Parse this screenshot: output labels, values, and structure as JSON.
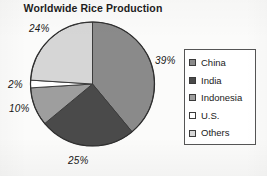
{
  "chart_data": {
    "type": "pie",
    "title": "Worldwide Rice Production",
    "xlabel": "",
    "ylabel": "",
    "legend_position": "right",
    "grid": false,
    "categories": [
      "China",
      "India",
      "Indonesia",
      "U.S.",
      "Others"
    ],
    "values": [
      39,
      25,
      10,
      2,
      24
    ],
    "value_labels": [
      "39%",
      "25%",
      "10%",
      "2%",
      "24%"
    ],
    "units": "percent",
    "start_angle_deg": 0,
    "direction": "clockwise",
    "slice_colors": [
      "#8a8a8a",
      "#4a4a4a",
      "#9e9e9e",
      "#ffffff",
      "#d6d6d6"
    ],
    "slices": [
      {
        "name": "China",
        "value": 39,
        "label": "39%",
        "color": "#8a8a8a"
      },
      {
        "name": "India",
        "value": 25,
        "label": "25%",
        "color": "#4a4a4a"
      },
      {
        "name": "Indonesia",
        "value": 10,
        "label": "10%",
        "color": "#9e9e9e"
      },
      {
        "name": "U.S.",
        "value": 2,
        "label": "2%",
        "color": "#ffffff"
      },
      {
        "name": "Others",
        "value": 24,
        "label": "24%",
        "color": "#d6d6d6"
      }
    ]
  },
  "title": "Worldwide Rice Production",
  "labels": {
    "china": "39%",
    "india": "25%",
    "indonesia": "10%",
    "us": "2%",
    "others": "24%"
  },
  "legend": {
    "items": [
      {
        "label": "China",
        "color": "#8a8a8a"
      },
      {
        "label": "India",
        "color": "#4a4a4a"
      },
      {
        "label": "Indonesia",
        "color": "#9e9e9e"
      },
      {
        "label": "U.S.",
        "color": "#ffffff"
      },
      {
        "label": "Others",
        "color": "#d6d6d6"
      }
    ]
  }
}
